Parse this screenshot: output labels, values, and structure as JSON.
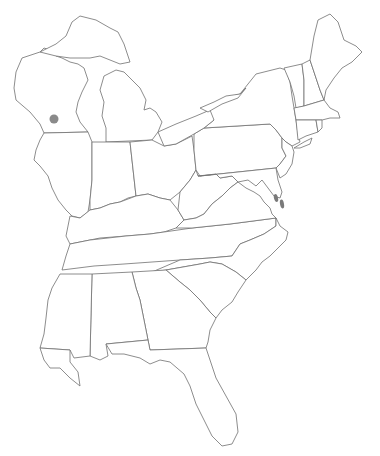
{
  "map": {
    "title": "",
    "region": "Eastern United States",
    "background": "#ffffff",
    "stroke_color": "#707070",
    "markers": [
      {
        "name": "marker-wisconsin",
        "x": 54,
        "y": 119,
        "rx": 4.5,
        "ry": 4.5,
        "color": "#8a8a8a"
      },
      {
        "name": "marker-delaware-1",
        "x": 276,
        "y": 198,
        "rx": 2,
        "ry": 4,
        "color": "#7a7a7a"
      },
      {
        "name": "marker-delaware-2",
        "x": 282,
        "y": 204,
        "rx": 2,
        "ry": 4.5,
        "color": "#7a7a7a"
      }
    ]
  }
}
